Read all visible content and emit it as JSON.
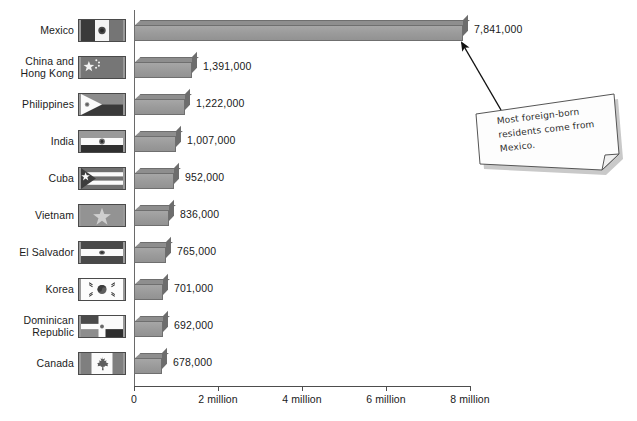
{
  "chart_data": {
    "type": "bar",
    "orientation": "horizontal",
    "title": "",
    "xlabel": "",
    "ylabel": "",
    "xlim": [
      0,
      8400000
    ],
    "grid": false,
    "legend": null,
    "categories": [
      "Mexico",
      "China and\nHong Kong",
      "Philippines",
      "India",
      "Cuba",
      "Vietnam",
      "El Salvador",
      "Korea",
      "Dominican\nRepublic",
      "Canada"
    ],
    "values": [
      7841000,
      1391000,
      1222000,
      1007000,
      952000,
      836000,
      765000,
      701000,
      692000,
      678000
    ],
    "value_labels": [
      "7,841,000",
      "1,391,000",
      "1,222,000",
      "1,007,000",
      "952,000",
      "836,000",
      "765,000",
      "701,000",
      "692,000",
      "678,000"
    ],
    "flags": [
      "mexico-flag",
      "china-flag",
      "philippines-flag",
      "india-flag",
      "cuba-flag",
      "vietnam-flag",
      "el-salvador-flag",
      "korea-flag",
      "dominican-republic-flag",
      "canada-flag"
    ],
    "xticks": [
      0,
      2000000,
      4000000,
      6000000,
      8000000
    ],
    "xtick_labels": [
      "0",
      "2 million",
      "4 million",
      "6 million",
      "8 million"
    ],
    "annotations": [
      {
        "name": "mexico-callout",
        "text": "Most foreign-born residents come from Mexico.",
        "points_to": "Mexico"
      }
    ],
    "colors": {
      "bar_face": "#9d9d9d",
      "bar_top": "#8e8e8e",
      "bar_side": "#6d6d6d",
      "axis": "#4d4d4d",
      "text": "#1a1a1a",
      "note_paper": "#fdfdfd"
    }
  }
}
